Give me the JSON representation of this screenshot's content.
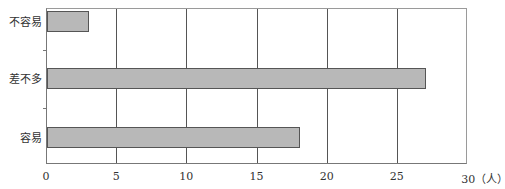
{
  "chart_data": {
    "type": "bar",
    "orientation": "horizontal",
    "title": "",
    "xlabel": "(人)",
    "ylabel": "",
    "categories": [
      "不容易",
      "差不多",
      "容易"
    ],
    "values": [
      3,
      27,
      18
    ],
    "xlim": [
      0,
      30
    ],
    "xticks": [
      "0",
      "5",
      "10",
      "15",
      "20",
      "25",
      "30（人）"
    ],
    "grid": "vertical",
    "legend": "none",
    "bar_color": "#b8b8b8",
    "bar_edge_color": "#555555"
  }
}
